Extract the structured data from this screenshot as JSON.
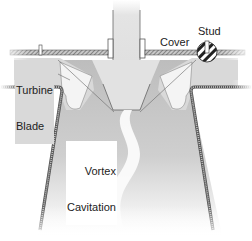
{
  "diagram": {
    "labels": {
      "cover": "Cover",
      "stud": "Stud",
      "turbine_blade_line1": "Turbine",
      "turbine_blade_line2": "Blade",
      "vortex_line1": "Vortex",
      "vortex_line2": "Cavitation"
    },
    "colors": {
      "shaft": "#e6e6e6",
      "wall_hatch": "#555555",
      "wall_fill": "#9a9a9a",
      "water_dark": "#b5b5b5",
      "water_light": "#efefef",
      "vortex": "#fafafa",
      "blade": "#d6d6d6",
      "outline": "#333333"
    },
    "components": [
      "shaft",
      "head-cover",
      "stud",
      "turbine-blade",
      "runner-hub",
      "draft-tube",
      "vortex-rope"
    ]
  }
}
